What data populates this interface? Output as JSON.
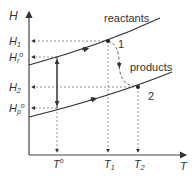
{
  "diagram": {
    "axes": {
      "y_label": "H",
      "x_label": "T"
    },
    "y_ticks": [
      {
        "label": "H",
        "sub": "1",
        "sup": "",
        "y": 41
      },
      {
        "label": "H",
        "sub": "r",
        "sup": "o",
        "y": 57
      },
      {
        "label": "H",
        "sub": "2",
        "sup": "",
        "y": 87
      },
      {
        "label": "H",
        "sub": "p",
        "sup": "o",
        "y": 108
      }
    ],
    "x_ticks": [
      {
        "label": "T",
        "sub": "",
        "sup": "o",
        "x": 57
      },
      {
        "label": "T",
        "sub": "1",
        "sup": "",
        "x": 108
      },
      {
        "label": "T",
        "sub": "2",
        "sup": "",
        "x": 138
      }
    ],
    "curves": {
      "reactants": "reactants",
      "products": "products"
    },
    "points": {
      "p1": "1",
      "p2": "2"
    },
    "colors": {
      "line": "#333333",
      "axis": "#444444",
      "dashed": "#777777"
    }
  }
}
